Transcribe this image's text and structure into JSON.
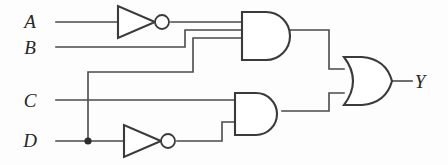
{
  "diagram": {
    "expression": "Y = (NOT A AND B AND D) OR (C AND NOT D)",
    "colors": {
      "background": "#fdfdfd",
      "wire": "#4a4a4a",
      "gate_outline": "#3a3a3a",
      "label": "#262626"
    }
  },
  "inputs": [
    {
      "id": "A",
      "label": "A",
      "x": 30,
      "y": 28
    },
    {
      "id": "B",
      "label": "B",
      "x": 30,
      "y": 54
    },
    {
      "id": "C",
      "label": "C",
      "x": 30,
      "y": 107
    },
    {
      "id": "D",
      "label": "D",
      "x": 30,
      "y": 147
    }
  ],
  "outputs": [
    {
      "id": "Y",
      "label": "Y",
      "x": 420,
      "y": 82
    }
  ],
  "gates": [
    {
      "id": "not-a",
      "type": "NOT",
      "name": "inverter-a",
      "inputs": [
        "A"
      ],
      "output": "notA"
    },
    {
      "id": "not-d",
      "type": "NOT",
      "name": "inverter-d",
      "inputs": [
        "D"
      ],
      "output": "notD"
    },
    {
      "id": "and-top",
      "type": "AND",
      "name": "and-gate-top",
      "input_count": 3,
      "inputs": [
        "notA",
        "B",
        "D"
      ],
      "output": "t1"
    },
    {
      "id": "and-bottom",
      "type": "AND",
      "name": "and-gate-bottom",
      "input_count": 2,
      "inputs": [
        "C",
        "notD"
      ],
      "output": "t2"
    },
    {
      "id": "or-out",
      "type": "OR",
      "name": "or-gate-output",
      "input_count": 2,
      "inputs": [
        "t1",
        "t2"
      ],
      "output": "Y"
    }
  ],
  "junctions": [
    {
      "id": "d-branch",
      "on_net": "D",
      "x": 88,
      "y": 141
    }
  ]
}
